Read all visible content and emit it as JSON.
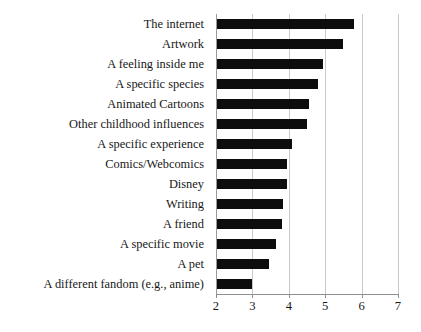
{
  "chart_data": {
    "type": "bar",
    "orientation": "horizontal",
    "title": "",
    "subtitle": "",
    "xlabel": "",
    "ylabel": "",
    "xlim": [
      2,
      7
    ],
    "ylim": null,
    "grid": true,
    "gridlines_axis": "x",
    "legend": null,
    "legend_position": "none",
    "bar_color": "#0d0d0d",
    "categories": [
      "The internet",
      "Artwork",
      "A feeling inside me",
      "A specific species",
      "Animated Cartoons",
      "Other childhood influences",
      "A specific experience",
      "Comics/Webcomics",
      "Disney",
      "Writing",
      "A friend",
      "A specific movie",
      "A pet",
      "A different fandom (e.g., anime)"
    ],
    "values": [
      5.8,
      5.5,
      4.95,
      4.8,
      4.55,
      4.5,
      4.1,
      3.95,
      3.95,
      3.85,
      3.8,
      3.65,
      3.45,
      3.0
    ],
    "xticks": [
      2,
      3,
      4,
      5,
      6,
      7
    ],
    "xticklabels": [
      "2",
      "3",
      "4",
      "5",
      "6",
      "7"
    ],
    "annotations": []
  }
}
